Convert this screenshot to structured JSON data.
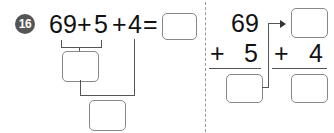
{
  "problem": {
    "number": "16",
    "expression": {
      "a": "69",
      "op1": "+",
      "b": "5",
      "op2": "+",
      "c": "4",
      "eq": "="
    },
    "vertical": {
      "top1": "69",
      "plus1": "+",
      "add1": "5",
      "plus2": "+",
      "add2": "4"
    }
  }
}
